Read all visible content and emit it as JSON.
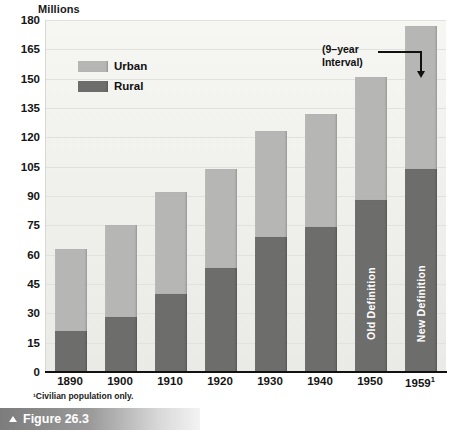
{
  "chart_data": {
    "type": "bar",
    "stacked": true,
    "title": "",
    "xlabel": "",
    "ylabel": "Millions",
    "ylim": [
      0,
      180
    ],
    "y_ticks": [
      0,
      15,
      30,
      45,
      60,
      75,
      90,
      105,
      120,
      135,
      150,
      165,
      180
    ],
    "grid": true,
    "legend_position": "top-left",
    "categories": [
      "1890",
      "1900",
      "1910",
      "1920",
      "1930",
      "1940",
      "1950",
      "1959"
    ],
    "category_labels": [
      "1890",
      "1900",
      "1910",
      "1920",
      "1930",
      "1940",
      "1950",
      "1959¹"
    ],
    "series": [
      {
        "name": "Rural",
        "color": "#6d6d6c",
        "values": [
          21,
          28,
          40,
          53,
          69,
          74,
          88,
          104
        ]
      },
      {
        "name": "Urban",
        "color": "#b6b6b4",
        "values": [
          42,
          47,
          52,
          51,
          54,
          58,
          63,
          73
        ]
      }
    ],
    "totals": [
      63,
      75,
      92,
      104,
      123,
      132,
      151,
      177
    ],
    "annotations": [
      {
        "text": "(9–year Interval)",
        "target": "1959",
        "style": "line-with-down-arrow"
      },
      {
        "text": "Old Definition",
        "target": "1950",
        "orientation": "vertical",
        "color": "#ffffff"
      },
      {
        "text": "New Definition",
        "target": "1959",
        "orientation": "vertical",
        "color": "#ffffff"
      }
    ],
    "footnote": "¹Civilian population only."
  },
  "axis": {
    "y_title": "Millions",
    "y_ticks": [
      "180",
      "165",
      "150",
      "135",
      "120",
      "105",
      "90",
      "75",
      "60",
      "45",
      "30",
      "15",
      "0"
    ],
    "x_ticks": [
      {
        "label": "1890"
      },
      {
        "label": "1900"
      },
      {
        "label": "1910"
      },
      {
        "label": "1920"
      },
      {
        "label": "1930"
      },
      {
        "label": "1940"
      },
      {
        "label": "1950"
      },
      {
        "label": "1959",
        "sup": "1"
      }
    ]
  },
  "legend": {
    "items": [
      {
        "label": "Urban",
        "color": "#b6b6b4"
      },
      {
        "label": "Rural",
        "color": "#6d6d6c"
      }
    ]
  },
  "annotation": {
    "line1": "(9–year",
    "line2": "Interval)"
  },
  "bar_labels": {
    "old_definition": "Old Definition",
    "new_definition": "New Definition"
  },
  "footnote": "¹Civilian population only.",
  "caption": {
    "text": "Figure 26.3"
  },
  "colors": {
    "urban": "#b6b6b4",
    "rural": "#6d6d6c",
    "plot_background": "#f2f2ef",
    "axis": "#111111"
  }
}
